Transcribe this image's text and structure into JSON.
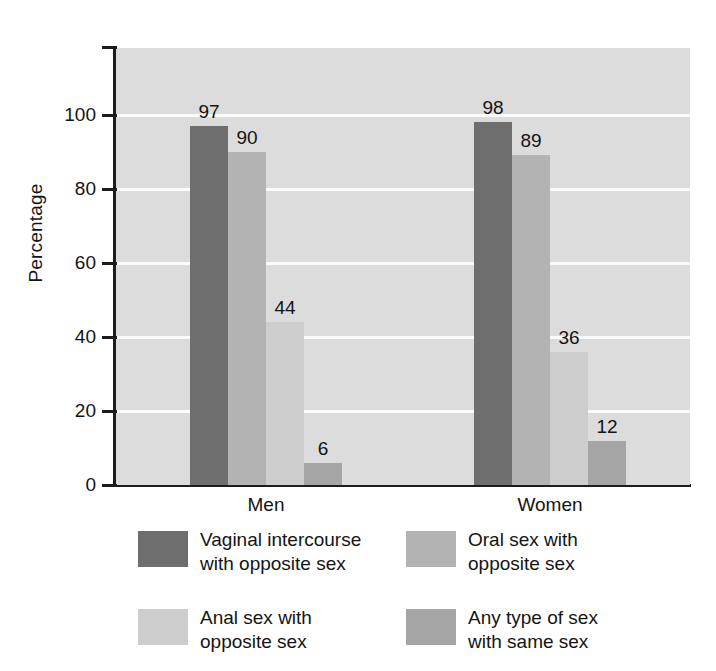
{
  "chart_data": {
    "type": "bar",
    "title": "",
    "subtitle": "",
    "xlabel": "",
    "ylabel": "Percentage",
    "categories": [
      "Men",
      "Women"
    ],
    "ylim": [
      0,
      118
    ],
    "yticks": [
      0,
      20,
      40,
      60,
      80,
      100
    ],
    "ytick_labels": [
      "0",
      "20",
      "40",
      "60",
      "80",
      "100"
    ],
    "grid": true,
    "grid_axis": "y",
    "legend_position": "below",
    "value_labels": true,
    "series": [
      {
        "name": "Vaginal intercourse with opposite sex",
        "legend_label": "Vaginal intercourse\nwith opposite sex",
        "color": "#6e6e6e",
        "values": [
          97,
          98
        ],
        "value_labels": [
          "97",
          "98"
        ]
      },
      {
        "name": "Oral sex with opposite sex",
        "legend_label": "Oral sex with\nopposite sex",
        "color": "#b3b3b3",
        "values": [
          90,
          89
        ],
        "value_labels": [
          "90",
          "89"
        ]
      },
      {
        "name": "Anal sex with opposite sex",
        "legend_label": "Anal sex with\nopposite sex",
        "color": "#cdcdcd",
        "values": [
          44,
          36
        ],
        "value_labels": [
          "44",
          "36"
        ]
      },
      {
        "name": "Any type of sex with same sex",
        "legend_label": "Any type of sex\nwith same sex",
        "color": "#a5a5a5",
        "values": [
          6,
          12
        ],
        "value_labels": [
          "6",
          "12"
        ]
      }
    ],
    "colors": {
      "plot_background": "#dcdcdc",
      "gridline": "#fbfbfb",
      "axis": "#1c1c1c",
      "text": "#141414",
      "figure_background": "#ffffff"
    }
  }
}
